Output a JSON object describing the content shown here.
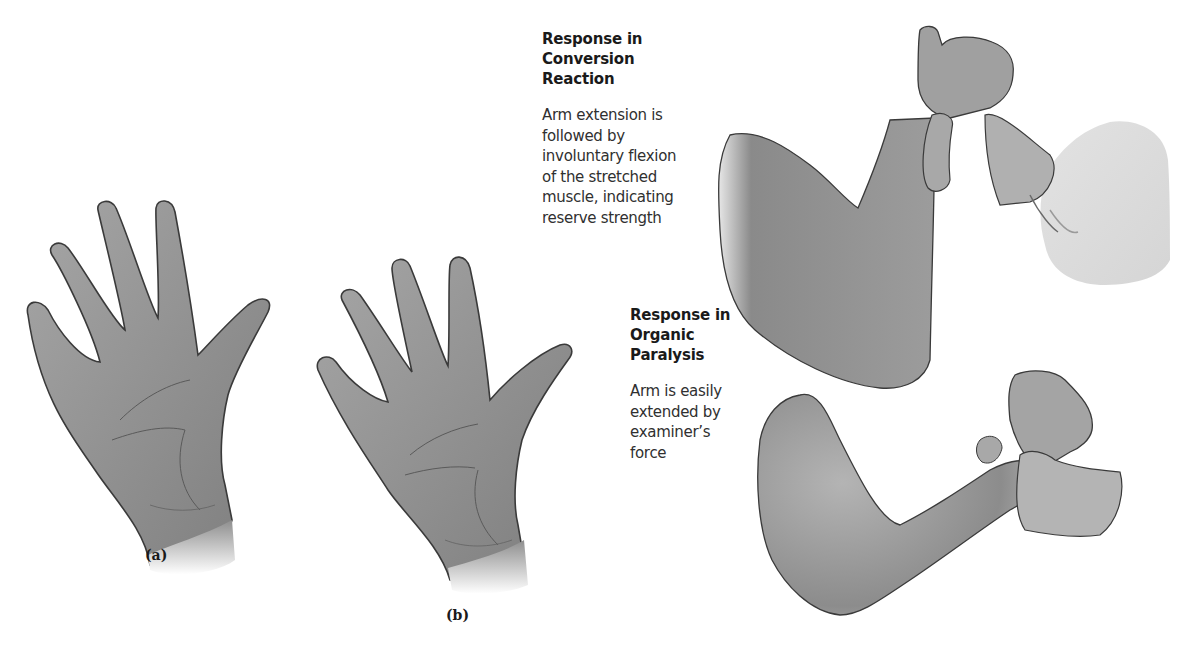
{
  "figure": {
    "panels": [
      {
        "id": "a",
        "label": "(a)",
        "subject": "open-hand-palm-left"
      },
      {
        "id": "b",
        "label": "(b)",
        "subject": "open-hand-palm-right"
      }
    ],
    "conversion_reaction": {
      "heading_lines": [
        "Response in",
        "Conversion",
        "Reaction"
      ],
      "body_lines": [
        "Arm extension is",
        "followed by",
        "involuntary flexion",
        "of the stretched",
        "muscle, indicating",
        "reserve strength"
      ]
    },
    "organic_paralysis": {
      "heading_lines": [
        "Response in",
        "Organic",
        "Paralysis"
      ],
      "body_lines": [
        "Arm is easily",
        "extended by",
        "examiner’s",
        "force"
      ]
    },
    "colors": {
      "skin_fill": "#9a9a9a",
      "skin_light": "#c4c4c4",
      "outline": "#3a3a3a",
      "background": "#ffffff",
      "text": "#2a2a2a"
    }
  }
}
